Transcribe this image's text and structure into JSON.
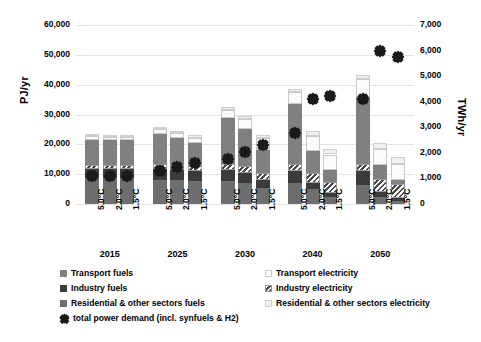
{
  "chart_data": {
    "type": "bar",
    "stacked": true,
    "title": "",
    "xlabel": "",
    "ylabel": "PJ/yr",
    "ylabel_secondary": "TWh/yr",
    "ylim": [
      0,
      60000
    ],
    "ylim_secondary": [
      0,
      7000
    ],
    "yticks": [
      "0",
      "10,000",
      "20,000",
      "30,000",
      "40,000",
      "50,000",
      "60,000"
    ],
    "yticks_secondary": [
      "0",
      "1,000",
      "2,000",
      "3,000",
      "4,000",
      "5,000",
      "6,000",
      "7,000"
    ],
    "grid": true,
    "legend_position": "bottom",
    "group_labels": [
      "2015",
      "2025",
      "2030",
      "2040",
      "2050"
    ],
    "scenario_labels": [
      "5.0°C",
      "2.0°C",
      "1.5°C"
    ],
    "series": [
      {
        "name": "Residential & other sectors fuels",
        "key": "resid_fuel",
        "values": [
          8600,
          8600,
          8600,
          8000,
          7900,
          7600,
          7600,
          7100,
          5500,
          7100,
          5000,
          2400,
          6500,
          2300,
          1100
        ]
      },
      {
        "name": "Industry fuels",
        "key": "industry_fuel",
        "values": [
          3300,
          3300,
          3300,
          3600,
          3400,
          3300,
          3800,
          3300,
          2400,
          4000,
          2200,
          1400,
          4400,
          1800,
          1000
        ]
      },
      {
        "name": "Industry electricity",
        "key": "industry_elec",
        "values": [
          1300,
          1300,
          1300,
          1700,
          1800,
          1900,
          1900,
          2200,
          2500,
          2300,
          3300,
          3600,
          2600,
          4200,
          4500
        ]
      },
      {
        "name": "Transport fuels",
        "key": "transport_fuel",
        "values": [
          8400,
          8100,
          8100,
          10300,
          8900,
          7600,
          15600,
          12600,
          7700,
          20000,
          7200,
          4100,
          22500,
          4900,
          1600
        ]
      },
      {
        "name": "Transport electricity",
        "key": "transport_elec",
        "values": [
          1100,
          1100,
          1100,
          1600,
          1700,
          1800,
          2600,
          3200,
          3900,
          4200,
          5000,
          5100,
          5900,
          5300,
          5100
        ]
      },
      {
        "name": "Residential & other sectors electricity",
        "key": "resid_elec",
        "values": [
          600,
          600,
          600,
          700,
          800,
          900,
          900,
          1100,
          1300,
          1100,
          1700,
          2000,
          1200,
          2100,
          2300
        ]
      }
    ],
    "marker_series": {
      "name": "total power demand (incl. synfuels & H2)",
      "unit": "TWh/yr",
      "values": [
        1250,
        1250,
        1250,
        1450,
        1600,
        1750,
        1900,
        2200,
        2450,
        2950,
        4250,
        4400,
        4250,
        6150,
        5900
      ]
    }
  },
  "axes": {
    "left_title": "PJ/yr",
    "right_title": "TWh/yr",
    "left_ticks": [
      {
        "label": "60,000",
        "value": 60000
      },
      {
        "label": "50,000",
        "value": 50000
      },
      {
        "label": "40,000",
        "value": 40000
      },
      {
        "label": "30,000",
        "value": 30000
      },
      {
        "label": "20,000",
        "value": 20000
      },
      {
        "label": "10,000",
        "value": 10000
      },
      {
        "label": "0",
        "value": 0
      }
    ],
    "right_ticks": [
      {
        "label": "7,000",
        "value": 7000
      },
      {
        "label": "6,000",
        "value": 6000
      },
      {
        "label": "5,000",
        "value": 5000
      },
      {
        "label": "4,000",
        "value": 4000
      },
      {
        "label": "3,000",
        "value": 3000
      },
      {
        "label": "2,000",
        "value": 2000
      },
      {
        "label": "1,000",
        "value": 1000
      },
      {
        "label": "0",
        "value": 0
      }
    ]
  },
  "legend": {
    "items": [
      {
        "label": "Transport fuels",
        "key": "transport_fuel",
        "column": 1,
        "row": 1
      },
      {
        "label": "Transport electricity",
        "key": "transport_elec",
        "column": 2,
        "row": 1
      },
      {
        "label": "Industry fuels",
        "key": "industry_fuel",
        "column": 1,
        "row": 2
      },
      {
        "label": "Industry electricity",
        "key": "industry_elec",
        "column": 2,
        "row": 2
      },
      {
        "label": "Residential & other sectors fuels",
        "key": "resid_fuel",
        "column": 1,
        "row": 3
      },
      {
        "label": "Residential & other sectors electricity",
        "key": "resid_elec",
        "column": 2,
        "row": 3
      },
      {
        "label": "total power demand (incl. synfuels & H2)",
        "key": "marker",
        "column": 1,
        "row": 4
      }
    ]
  },
  "colors": {
    "transport_fuel": "#808080",
    "industry_fuel": "#3b3b3b",
    "resid_fuel": "#6e6e6e",
    "transport_elec": "#fbfbfb",
    "industry_elec": "#ffffff",
    "resid_elec": "#efefef",
    "marker": "#1a1a1a",
    "grid": "#e3e3e3"
  }
}
